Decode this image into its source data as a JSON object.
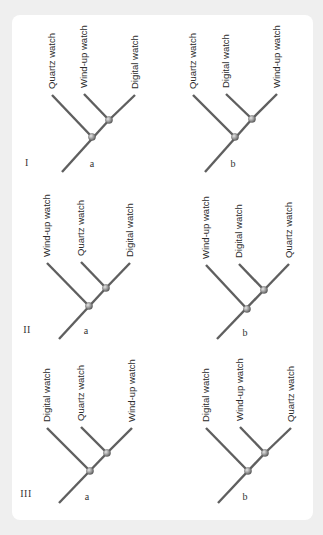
{
  "figure": {
    "colors": {
      "background": "#efefef",
      "panel": "#ffffff",
      "branch": "#5f5f5f",
      "node": "#8a8a8a",
      "text": "#2a2a2a"
    },
    "rows": [
      {
        "numeral": "I",
        "numeral_pos": [
          27,
          166
        ],
        "trees": [
          {
            "letter": "a",
            "letter_pos": [
              92,
              167
            ],
            "root": [
              62,
              172
            ],
            "root_node": [
              92,
              137
            ],
            "inner_node": [
              109,
              120
            ],
            "leaves": [
              {
                "label": "Quartz watch",
                "tip": [
                  52,
                  95
                ],
                "attach": "root_node"
              },
              {
                "label": "Wind-up watch",
                "tip": [
                  84,
                  94
                ],
                "attach": "inner_node"
              },
              {
                "label": "Digital watch",
                "tip": [
                  135,
                  95
                ],
                "attach": "inner_node"
              }
            ]
          },
          {
            "letter": "b",
            "letter_pos": [
              233,
              167
            ],
            "root": [
              205,
              172
            ],
            "root_node": [
              235,
              137
            ],
            "inner_node": [
              252,
              119
            ],
            "leaves": [
              {
                "label": "Quartz watch",
                "tip": [
                  193,
                  95
                ],
                "attach": "root_node"
              },
              {
                "label": "Digital watch",
                "tip": [
                  226,
                  94
                ],
                "attach": "inner_node"
              },
              {
                "label": "Wind-up watch",
                "tip": [
                  277,
                  94
                ],
                "attach": "inner_node"
              }
            ]
          }
        ]
      },
      {
        "numeral": "II",
        "numeral_pos": [
          27,
          333
        ],
        "trees": [
          {
            "letter": "a",
            "letter_pos": [
              86,
              334
            ],
            "root": [
              59,
              339
            ],
            "root_node": [
              89,
              306
            ],
            "inner_node": [
              106,
              288
            ],
            "leaves": [
              {
                "label": "Wind-up watch",
                "tip": [
                  47,
                  263
                ],
                "attach": "root_node"
              },
              {
                "label": "Quartz watch",
                "tip": [
                  81,
                  262
                ],
                "attach": "inner_node"
              },
              {
                "label": "Digital watch",
                "tip": [
                  130,
                  263
                ],
                "attach": "inner_node"
              }
            ]
          },
          {
            "letter": "b",
            "letter_pos": [
              245,
              336
            ],
            "root": [
              217,
              339
            ],
            "root_node": [
              247,
              309
            ],
            "inner_node": [
              264,
              290
            ],
            "leaves": [
              {
                "label": "Wind-up watch",
                "tip": [
                  206,
                  265
                ],
                "attach": "root_node"
              },
              {
                "label": "Digital watch",
                "tip": [
                  239,
                  264
                ],
                "attach": "inner_node"
              },
              {
                "label": "Quartz watch",
                "tip": [
                  289,
                  264
                ],
                "attach": "inner_node"
              }
            ]
          }
        ]
      },
      {
        "numeral": "III",
        "numeral_pos": [
          26,
          497
        ],
        "trees": [
          {
            "letter": "a",
            "letter_pos": [
              87,
              500
            ],
            "root": [
              59,
              503
            ],
            "root_node": [
              90,
              471
            ],
            "inner_node": [
              107,
              453
            ],
            "leaves": [
              {
                "label": "Digital watch",
                "tip": [
                  47,
                  428
                ],
                "attach": "root_node"
              },
              {
                "label": "Quartz watch",
                "tip": [
                  81,
                  427
                ],
                "attach": "inner_node"
              },
              {
                "label": "Wind-up watch",
                "tip": [
                  132,
                  428
                ],
                "attach": "inner_node"
              }
            ]
          },
          {
            "letter": "b",
            "letter_pos": [
              245,
              500
            ],
            "root": [
              218,
              503
            ],
            "root_node": [
              248,
              471
            ],
            "inner_node": [
              265,
              453
            ],
            "leaves": [
              {
                "label": "Digital watch",
                "tip": [
                  206,
                  428
                ],
                "attach": "root_node"
              },
              {
                "label": "Wind-up watch",
                "tip": [
                  240,
                  427
                ],
                "attach": "inner_node"
              },
              {
                "label": "Quartz watch",
                "tip": [
                  291,
                  428
                ],
                "attach": "inner_node"
              }
            ]
          }
        ]
      }
    ]
  }
}
